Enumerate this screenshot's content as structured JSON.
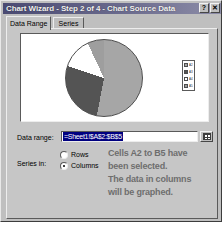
{
  "window": {
    "title": "Chart Wizard - Step 2 of 4 - Chart Source Data",
    "help_button": "?",
    "close_button": "✕"
  },
  "tabs": [
    {
      "label": "Data Range",
      "active": true
    },
    {
      "label": "Series",
      "active": false
    }
  ],
  "preview": {
    "legend": [
      {
        "label": "A2",
        "color": "#a6a6a6"
      },
      {
        "label": "A3",
        "color": "#545454"
      },
      {
        "label": "A4",
        "color": "#ffffff"
      },
      {
        "label": "A5",
        "color": "#9e9e9e"
      }
    ]
  },
  "chart_data": {
    "type": "pie",
    "title": "",
    "categories": [
      "A2",
      "A3",
      "A4",
      "A5"
    ],
    "values": [
      53,
      27,
      13,
      7
    ],
    "colors": [
      "#a6a6a6",
      "#545454",
      "#ffffff",
      "#9e9e9e"
    ],
    "legend_position": "right",
    "grid": false
  },
  "data_range": {
    "label": "Data range:",
    "value": "=Sheet1!$A$2:$B$5",
    "picker_icon": "range-select-icon"
  },
  "series_in": {
    "label": "Series in:",
    "options": [
      {
        "label": "Rows",
        "selected": false
      },
      {
        "label": "Columns",
        "selected": true
      }
    ]
  },
  "annotation": {
    "line1": "Cells A2 to B5 have",
    "line2": "been selected.",
    "line3": "The data in columns",
    "line4": "will be graphed."
  }
}
